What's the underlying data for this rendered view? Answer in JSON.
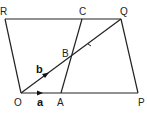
{
  "diagram": {
    "type": "geometry-parallelograms",
    "points": {
      "R": {
        "label": "R",
        "x": 5,
        "y": 19
      },
      "C": {
        "label": "C",
        "x": 82,
        "y": 19
      },
      "Q": {
        "label": "Q",
        "x": 121,
        "y": 19
      },
      "O": {
        "label": "O",
        "x": 21,
        "y": 93
      },
      "A": {
        "label": "A",
        "x": 61,
        "y": 93
      },
      "P": {
        "label": "P",
        "x": 138,
        "y": 93
      },
      "B": {
        "label": "B",
        "x": 72,
        "y": 57
      }
    },
    "vectors": {
      "a": {
        "label": "a",
        "from": "O",
        "to": "A"
      },
      "b": {
        "label": "b",
        "from": "O",
        "to": "Q"
      }
    },
    "segments": [
      "R-Q",
      "O-P",
      "O-R",
      "P-Q",
      "A-C",
      "O-Q"
    ],
    "colors": {
      "line": "#222222",
      "background": "#ffffff"
    }
  }
}
